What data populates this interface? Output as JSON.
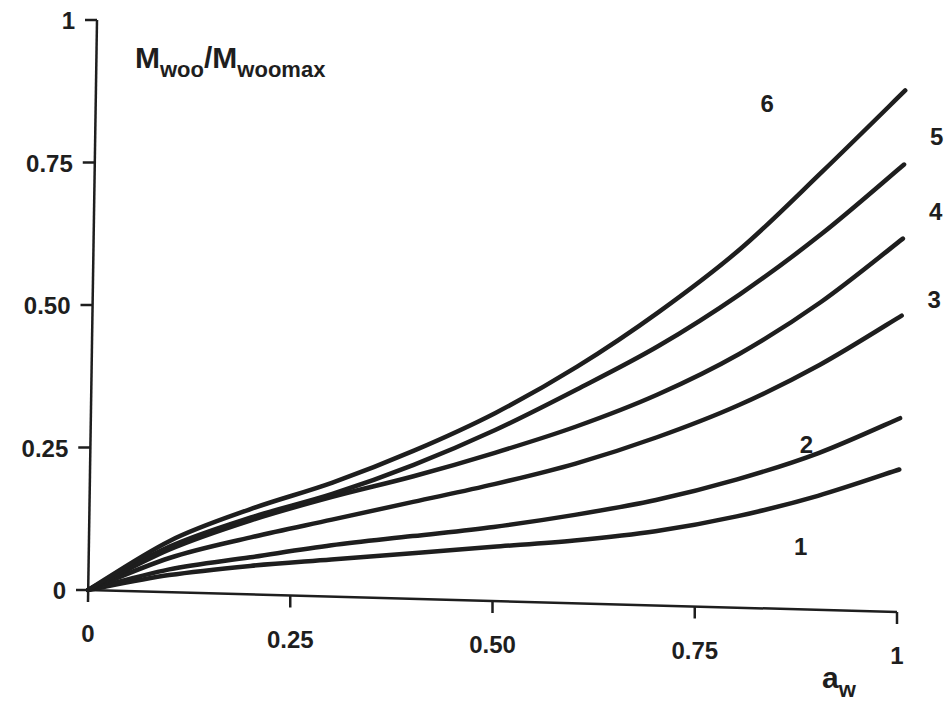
{
  "chart_data": {
    "type": "line",
    "title": "",
    "xlabel": "a_w",
    "xlabel_main": "a",
    "xlabel_sub": "w",
    "ylabel": "M_woo/M_woomax",
    "ylabel_parts": {
      "m1": "M",
      "s1": "woo",
      "slash": "/",
      "m2": "M",
      "s2": "woomax"
    },
    "xlim": [
      0,
      1
    ],
    "ylim": [
      0,
      1
    ],
    "grid": false,
    "legend": "inline curve numbers at right ends",
    "x_ticks": [
      0,
      0.25,
      0.5,
      0.75,
      1
    ],
    "x_tick_labels": [
      "0",
      "0.25",
      "0.50",
      "0.75",
      "1"
    ],
    "y_ticks": [
      0,
      0.25,
      0.5,
      0.75,
      1
    ],
    "y_tick_labels": [
      "0",
      "0.25",
      "0.50",
      "0.75",
      "1"
    ],
    "x": [
      0,
      0.1,
      0.2,
      0.3,
      0.4,
      0.5,
      0.6,
      0.7,
      0.8,
      0.9,
      1.0
    ],
    "series": [
      {
        "name": "1",
        "values": [
          0,
          0.03,
          0.05,
          0.065,
          0.08,
          0.095,
          0.11,
          0.13,
          0.16,
          0.2,
          0.25
        ]
      },
      {
        "name": "2",
        "values": [
          0,
          0.04,
          0.065,
          0.09,
          0.11,
          0.13,
          0.155,
          0.185,
          0.225,
          0.275,
          0.34
        ]
      },
      {
        "name": "3",
        "values": [
          0,
          0.06,
          0.1,
          0.135,
          0.17,
          0.205,
          0.245,
          0.295,
          0.355,
          0.43,
          0.52
        ]
      },
      {
        "name": "4",
        "values": [
          0,
          0.075,
          0.13,
          0.175,
          0.215,
          0.26,
          0.31,
          0.37,
          0.445,
          0.54,
          0.655
        ]
      },
      {
        "name": "5",
        "values": [
          0,
          0.08,
          0.135,
          0.18,
          0.235,
          0.3,
          0.375,
          0.455,
          0.55,
          0.66,
          0.785
        ]
      },
      {
        "name": "6",
        "values": [
          0,
          0.09,
          0.15,
          0.2,
          0.26,
          0.33,
          0.415,
          0.515,
          0.63,
          0.77,
          0.915
        ]
      }
    ],
    "series_label_positions": [
      {
        "name": "1",
        "x": 0.88,
        "y": 0.095
      },
      {
        "name": "2",
        "x": 0.885,
        "y": 0.275
      },
      {
        "name": "3",
        "x": 1.04,
        "y": 0.535
      },
      {
        "name": "4",
        "x": 1.04,
        "y": 0.69
      },
      {
        "name": "5",
        "x": 1.04,
        "y": 0.82
      },
      {
        "name": "6",
        "x": 0.83,
        "y": 0.87
      }
    ]
  },
  "colors": {
    "line": "#1e1e1e",
    "background": "#ffffff"
  }
}
